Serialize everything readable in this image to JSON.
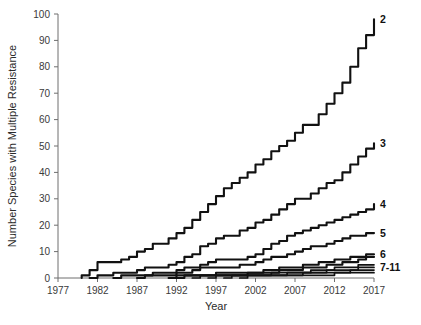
{
  "chart_data": {
    "type": "line",
    "title": "",
    "xlabel": "Year",
    "ylabel": "Number Species with Multiple Resistance",
    "xlim": [
      1977,
      2017
    ],
    "ylim": [
      0,
      100
    ],
    "grid": false,
    "legend_position": "right-end-of-line",
    "xticks": [
      1977,
      1982,
      1987,
      1992,
      1997,
      2002,
      2007,
      2012,
      2017
    ],
    "yticks": [
      0,
      10,
      20,
      30,
      40,
      50,
      60,
      70,
      80,
      90,
      100
    ],
    "x": [
      1980,
      1981,
      1982,
      1983,
      1984,
      1985,
      1986,
      1987,
      1988,
      1989,
      1990,
      1991,
      1992,
      1993,
      1994,
      1995,
      1996,
      1997,
      1998,
      1999,
      2000,
      2001,
      2002,
      2003,
      2004,
      2005,
      2006,
      2007,
      2008,
      2009,
      2010,
      2011,
      2012,
      2013,
      2014,
      2015,
      2016,
      2017
    ],
    "series": [
      {
        "name": "2",
        "label": "2",
        "label_value": 98,
        "values": [
          1,
          3,
          6,
          6,
          6,
          7,
          8,
          10,
          11,
          13,
          13,
          15,
          17,
          19,
          22,
          25,
          28,
          31,
          34,
          36,
          38,
          40,
          43,
          45,
          48,
          50,
          52,
          55,
          58,
          58,
          62,
          66,
          70,
          74,
          80,
          87,
          92,
          98
        ]
      },
      {
        "name": "3",
        "label": "3",
        "label_value": 51,
        "values": [
          0,
          0,
          1,
          1,
          2,
          2,
          2,
          3,
          4,
          4,
          4,
          5,
          6,
          8,
          9,
          12,
          13,
          15,
          16,
          16,
          18,
          19,
          21,
          22,
          24,
          26,
          28,
          30,
          30,
          32,
          34,
          36,
          37,
          40,
          43,
          46,
          49,
          51
        ]
      },
      {
        "name": "4",
        "label": "4",
        "label_value": 28,
        "values": [
          0,
          0,
          0,
          0,
          0,
          1,
          1,
          1,
          1,
          2,
          2,
          2,
          3,
          4,
          4,
          5,
          6,
          7,
          7,
          7,
          7,
          8,
          9,
          11,
          13,
          14,
          16,
          17,
          18,
          19,
          20,
          21,
          22,
          23,
          24,
          25,
          26,
          28
        ]
      },
      {
        "name": "5",
        "label": "5",
        "label_value": 17,
        "values": [
          0,
          0,
          0,
          0,
          0,
          0,
          0,
          0,
          1,
          1,
          1,
          1,
          2,
          2,
          3,
          4,
          4,
          4,
          4,
          4,
          5,
          5,
          6,
          7,
          8,
          8,
          9,
          10,
          11,
          12,
          12,
          13,
          14,
          15,
          16,
          16,
          17,
          17
        ]
      },
      {
        "name": "6",
        "label": "6",
        "label_value": 9,
        "values": [
          0,
          0,
          0,
          0,
          0,
          0,
          0,
          0,
          0,
          0,
          0,
          0,
          1,
          1,
          1,
          1,
          1,
          2,
          2,
          2,
          2,
          2,
          2,
          3,
          3,
          4,
          4,
          4,
          5,
          5,
          6,
          6,
          7,
          7,
          8,
          8,
          9,
          9
        ]
      },
      {
        "name": "7",
        "label": "",
        "label_value": 8,
        "values": [
          0,
          0,
          0,
          0,
          0,
          0,
          0,
          0,
          0,
          0,
          0,
          0,
          0,
          1,
          1,
          1,
          1,
          1,
          1,
          1,
          1,
          2,
          2,
          2,
          2,
          3,
          3,
          3,
          4,
          4,
          4,
          5,
          5,
          6,
          6,
          7,
          8,
          8
        ]
      },
      {
        "name": "8",
        "label": "",
        "label_value": 5,
        "values": [
          0,
          0,
          0,
          0,
          0,
          0,
          0,
          0,
          0,
          0,
          0,
          0,
          0,
          0,
          0,
          1,
          1,
          1,
          1,
          1,
          1,
          1,
          1,
          1,
          2,
          2,
          2,
          2,
          2,
          3,
          3,
          3,
          4,
          4,
          4,
          5,
          5,
          5
        ]
      },
      {
        "name": "9",
        "label": "",
        "label_value": 4,
        "values": [
          0,
          0,
          0,
          0,
          0,
          0,
          0,
          0,
          0,
          0,
          0,
          0,
          0,
          0,
          0,
          0,
          0,
          1,
          1,
          1,
          1,
          1,
          1,
          1,
          1,
          1,
          2,
          2,
          2,
          2,
          2,
          3,
          3,
          3,
          3,
          4,
          4,
          4
        ]
      },
      {
        "name": "10",
        "label": "",
        "label_value": 3,
        "values": [
          0,
          0,
          0,
          0,
          0,
          0,
          0,
          0,
          0,
          0,
          0,
          0,
          0,
          0,
          0,
          0,
          0,
          0,
          0,
          1,
          1,
          1,
          1,
          1,
          1,
          1,
          1,
          1,
          2,
          2,
          2,
          2,
          2,
          2,
          3,
          3,
          3,
          3
        ]
      },
      {
        "name": "11",
        "label": "",
        "label_value": 2,
        "values": [
          0,
          0,
          0,
          0,
          0,
          0,
          0,
          0,
          0,
          0,
          0,
          0,
          0,
          0,
          0,
          0,
          0,
          0,
          0,
          0,
          0,
          1,
          1,
          1,
          1,
          1,
          1,
          1,
          1,
          1,
          1,
          1,
          2,
          2,
          2,
          2,
          2,
          2
        ]
      }
    ],
    "series_labels": [
      {
        "text": "2",
        "value": 98
      },
      {
        "text": "3",
        "value": 51
      },
      {
        "text": "4",
        "value": 28
      },
      {
        "text": "5",
        "value": 17
      },
      {
        "text": "6",
        "value": 9
      },
      {
        "text": "7-11",
        "value": 4
      }
    ]
  },
  "axes": {
    "x_title": "Year",
    "y_title": "Number Species with Multiple Resistance",
    "x_tick_labels": [
      "1977",
      "1982",
      "1987",
      "1992",
      "1997",
      "2002",
      "2007",
      "2012",
      "2017"
    ],
    "y_tick_labels": [
      "0",
      "10",
      "20",
      "30",
      "40",
      "50",
      "60",
      "70",
      "80",
      "90",
      "100"
    ]
  },
  "colors": {
    "line": "#111111",
    "axis": "#6e6e6e",
    "text": "#2b2b2b",
    "background": "#ffffff"
  }
}
